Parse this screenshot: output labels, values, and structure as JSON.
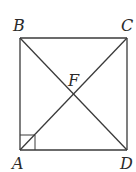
{
  "diagram": {
    "type": "geometry",
    "shape": "square",
    "points": {
      "A": {
        "label": "A",
        "x": 20,
        "y": 150
      },
      "B": {
        "label": "B",
        "x": 20,
        "y": 38
      },
      "C": {
        "label": "C",
        "x": 127,
        "y": 38
      },
      "D": {
        "label": "D",
        "x": 127,
        "y": 150
      },
      "F": {
        "label": "F",
        "x": 73.5,
        "y": 94
      }
    },
    "segments": [
      "AB",
      "BC",
      "CD",
      "DA",
      "AC",
      "BD"
    ],
    "right_angle_marker": {
      "at": "A",
      "size": 15
    },
    "colors": {
      "line": "#3a3a3a",
      "label": "#2a2a2a",
      "background": "#ffffff"
    }
  }
}
